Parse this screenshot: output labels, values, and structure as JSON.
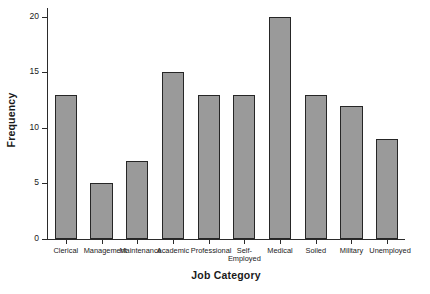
{
  "chart_data": {
    "type": "bar",
    "title": "",
    "xlabel": "Job Category",
    "ylabel": "Frequency",
    "categories": [
      "Clerical",
      "Management",
      "Maintenance",
      "Academic",
      "Professional",
      "Self-\nEmployed",
      "Medical",
      "Soiled",
      "Military",
      "Unemployed"
    ],
    "values": [
      13,
      5,
      7,
      15,
      13,
      13,
      20,
      13,
      12,
      9
    ],
    "ylim": [
      0,
      20.8
    ],
    "yticks": [
      0,
      5,
      10,
      15,
      20
    ],
    "ytick_labels": [
      "0",
      "5",
      "10",
      "15",
      "20"
    ],
    "grid": false,
    "legend": false,
    "bar_color": "#9a9a9a",
    "bar_edge_color": "#262626",
    "axis_color": "#2b2b2b",
    "background": "#ffffff"
  }
}
